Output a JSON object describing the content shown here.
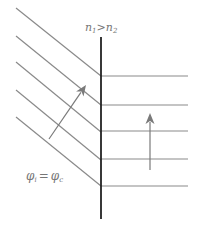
{
  "diagram": {
    "labels": {
      "index_relation": {
        "n1": "n",
        "n1_sub": "1",
        "op": ">",
        "n2": "n",
        "n2_sub": "2"
      },
      "angle_relation": {
        "lhs": "φ",
        "lhs_sub": "i",
        "eq": "=",
        "rhs": "φ",
        "rhs_sub": "c"
      }
    },
    "colors": {
      "ray_line": "#8a8a8a",
      "interface": "#222222",
      "arrow": "#7a7a7a",
      "label": "#777777"
    },
    "interface": {
      "x": 101,
      "y1": 37,
      "y2": 219
    },
    "incident_wavefronts": [
      {
        "x1": 16,
        "y1": 8,
        "x2": 101,
        "y2": 76
      },
      {
        "x1": 16,
        "y1": 36,
        "x2": 101,
        "y2": 105
      },
      {
        "x1": 16,
        "y1": 62,
        "x2": 101,
        "y2": 132
      },
      {
        "x1": 16,
        "y1": 90,
        "x2": 101,
        "y2": 160
      },
      {
        "x1": 16,
        "y1": 117,
        "x2": 101,
        "y2": 186
      }
    ],
    "refracted_wavefronts": [
      {
        "y": 76
      },
      {
        "y": 105
      },
      {
        "y": 131
      },
      {
        "y": 159
      },
      {
        "y": 186
      }
    ],
    "refracted_x_end": 188,
    "incident_arrow": {
      "x1": 49,
      "y1": 139,
      "x2": 86,
      "y2": 85
    },
    "refracted_arrow": {
      "x1": 150,
      "y1": 170,
      "x2": 150,
      "y2": 113
    }
  }
}
